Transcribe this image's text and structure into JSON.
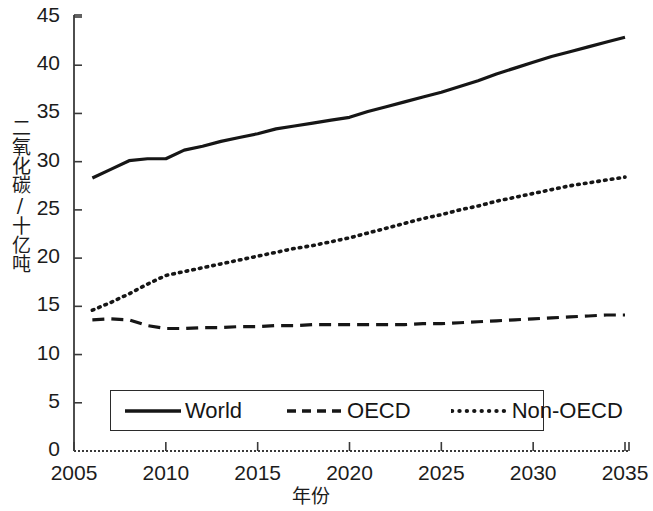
{
  "chart_data": {
    "type": "line",
    "title": "",
    "subtitle": "",
    "xlabel": "年份",
    "ylabel": "二氧化碳/十亿吨",
    "xlim": [
      2005,
      2035
    ],
    "ylim": [
      0,
      45
    ],
    "xticks": [
      2005,
      2010,
      2015,
      2020,
      2025,
      2030,
      2035
    ],
    "yticks": [
      0,
      5,
      10,
      15,
      20,
      25,
      30,
      35,
      40,
      45
    ],
    "grid": false,
    "legend_position": "lower center",
    "legend_entries": [
      "World",
      "OECD",
      "Non-OECD"
    ],
    "x": [
      2006,
      2007,
      2008,
      2009,
      2010,
      2011,
      2012,
      2013,
      2014,
      2015,
      2016,
      2017,
      2018,
      2019,
      2020,
      2021,
      2022,
      2023,
      2024,
      2025,
      2026,
      2027,
      2028,
      2029,
      2030,
      2031,
      2032,
      2033,
      2034,
      2035
    ],
    "series": [
      {
        "name": "World",
        "style": "solid",
        "color": "#161616",
        "values": [
          28.3,
          29.2,
          30.1,
          30.3,
          30.3,
          31.2,
          31.6,
          32.1,
          32.5,
          32.9,
          33.4,
          33.7,
          34.0,
          34.3,
          34.6,
          35.2,
          35.7,
          36.2,
          36.7,
          37.2,
          37.8,
          38.4,
          39.1,
          39.7,
          40.3,
          40.9,
          41.4,
          41.9,
          42.4,
          42.9
        ]
      },
      {
        "name": "OECD",
        "style": "dashed",
        "color": "#161616",
        "values": [
          13.6,
          13.7,
          13.6,
          13.0,
          12.7,
          12.7,
          12.8,
          12.8,
          12.9,
          12.9,
          13.0,
          13.0,
          13.1,
          13.1,
          13.1,
          13.1,
          13.1,
          13.1,
          13.2,
          13.2,
          13.3,
          13.4,
          13.5,
          13.6,
          13.7,
          13.8,
          13.9,
          14.0,
          14.1,
          14.1
        ]
      },
      {
        "name": "Non-OECD",
        "style": "dotted",
        "color": "#161616",
        "values": [
          14.6,
          15.4,
          16.3,
          17.3,
          18.2,
          18.6,
          19.0,
          19.4,
          19.8,
          20.2,
          20.6,
          21.0,
          21.3,
          21.7,
          22.1,
          22.6,
          23.1,
          23.6,
          24.1,
          24.5,
          25.0,
          25.4,
          25.9,
          26.3,
          26.7,
          27.1,
          27.5,
          27.8,
          28.1,
          28.4
        ]
      }
    ]
  },
  "axes": {
    "y_tick_labels": [
      "45",
      "40",
      "35",
      "30",
      "25",
      "20",
      "15",
      "10",
      "5",
      "0"
    ],
    "x_tick_labels": [
      "2005",
      "2010",
      "2015",
      "2020",
      "2025",
      "2030",
      "2035"
    ],
    "y_title": "二氧化碳/十亿吨",
    "x_title": "年份"
  },
  "legend": {
    "items": [
      {
        "label": "World",
        "style": "solid"
      },
      {
        "label": "OECD",
        "style": "dashed"
      },
      {
        "label": "Non-OECD",
        "style": "dotted"
      }
    ]
  },
  "colors": {
    "ink": "#161616",
    "axis": "#3a3a3a",
    "background": "#ffffff"
  }
}
